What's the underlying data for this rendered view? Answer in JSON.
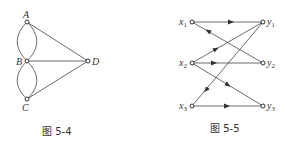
{
  "figures": [
    {
      "id": "fig-5-4",
      "caption": "图 5-4",
      "type": "undirected-multigraph",
      "nodes": [
        "A",
        "B",
        "C",
        "D"
      ],
      "edges": [
        {
          "from": "A",
          "to": "B",
          "multiplicity": 2
        },
        {
          "from": "B",
          "to": "C",
          "multiplicity": 2
        },
        {
          "from": "A",
          "to": "D",
          "multiplicity": 1
        },
        {
          "from": "B",
          "to": "D",
          "multiplicity": 1
        },
        {
          "from": "C",
          "to": "D",
          "multiplicity": 1
        }
      ]
    },
    {
      "id": "fig-5-5",
      "caption": "图 5-5",
      "type": "directed-bipartite-graph",
      "left_nodes": [
        {
          "name": "x",
          "sub": "1"
        },
        {
          "name": "x",
          "sub": "2"
        },
        {
          "name": "x",
          "sub": "3"
        }
      ],
      "right_nodes": [
        {
          "name": "y",
          "sub": "1"
        },
        {
          "name": "y",
          "sub": "2"
        },
        {
          "name": "y",
          "sub": "3"
        }
      ],
      "edges": [
        {
          "from": "x1",
          "to": "y1"
        },
        {
          "from": "y2",
          "to": "x1"
        },
        {
          "from": "x2",
          "to": "y1"
        },
        {
          "from": "x2",
          "to": "y2"
        },
        {
          "from": "x2",
          "to": "y3"
        },
        {
          "from": "y1",
          "to": "x3"
        },
        {
          "from": "x3",
          "to": "y3"
        }
      ]
    }
  ]
}
